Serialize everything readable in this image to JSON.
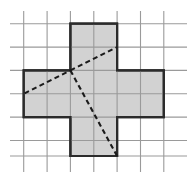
{
  "figure": {
    "canvas": {
      "width": 190,
      "height": 179
    },
    "colors": {
      "background": "#ffffff",
      "grid_line": "#9a9a9a",
      "shape_fill": "#d2d2d2",
      "shape_outline": "#2b2b2b",
      "dashed_line": "#1a1a1a"
    },
    "grid": {
      "cell_size": 23.4,
      "columns": 7,
      "rows": 6,
      "x_positions": [
        10.0,
        23.7,
        47.1,
        70.4,
        93.8,
        117.1,
        140.5,
        163.8,
        187.0
      ],
      "y_positions": [
        23.7,
        47.1,
        70.4,
        93.8,
        117.1,
        140.5,
        156.0
      ],
      "vertical_lines_x": [
        23.7,
        47.1,
        70.4,
        93.8,
        117.1,
        140.5,
        163.8
      ],
      "horizontal_lines_y": [
        23.7,
        47.1,
        70.4,
        93.8,
        117.1,
        140.5,
        156.0
      ],
      "vertical_span_y": [
        11.0,
        172.0
      ],
      "horizontal_span_x": [
        10.0,
        187.0
      ],
      "stroke_width": 1.1
    },
    "shape": {
      "name": "plus-polyomino",
      "cell_count": 5,
      "outline_path": "M 70.4 23.7 L 117.1 23.7 L 117.1 70.4 L 163.8 70.4 L 163.8 117.1 L 117.1 117.1 L 117.1 156.0 L 70.4 156.0 L 70.4 117.1 L 23.7 117.1 L 23.7 70.4 L 70.4 70.4 Z",
      "stroke_width": 2.2,
      "arms": {
        "top": {
          "x": [
            70.4,
            117.1
          ],
          "y": [
            23.7,
            70.4
          ]
        },
        "left": {
          "x": [
            23.7,
            70.4
          ],
          "y": [
            70.4,
            117.1
          ]
        },
        "center": {
          "x": [
            70.4,
            117.1
          ],
          "y": [
            70.4,
            117.1
          ]
        },
        "right": {
          "x": [
            117.1,
            163.8
          ],
          "y": [
            70.4,
            117.1
          ]
        },
        "bottom": {
          "x": [
            70.4,
            117.1
          ],
          "y": [
            117.1,
            156.0
          ]
        }
      }
    },
    "dashed_segments": [
      {
        "name": "segment-left-to-vertex",
        "from": {
          "x": 24.5,
          "y": 93.4
        },
        "to": {
          "x": 70.4,
          "y": 70.4
        }
      },
      {
        "name": "segment-vertex-to-upper-right",
        "from": {
          "x": 70.4,
          "y": 70.4
        },
        "to": {
          "x": 117.1,
          "y": 47.1
        }
      },
      {
        "name": "segment-vertex-to-lower-right",
        "from": {
          "x": 70.4,
          "y": 70.4
        },
        "to": {
          "x": 117.1,
          "y": 156.0
        }
      }
    ],
    "dash_pattern": "5,3.4",
    "dash_stroke_width": 2.1,
    "vertex_point": {
      "x": 70.4,
      "y": 70.4
    }
  }
}
